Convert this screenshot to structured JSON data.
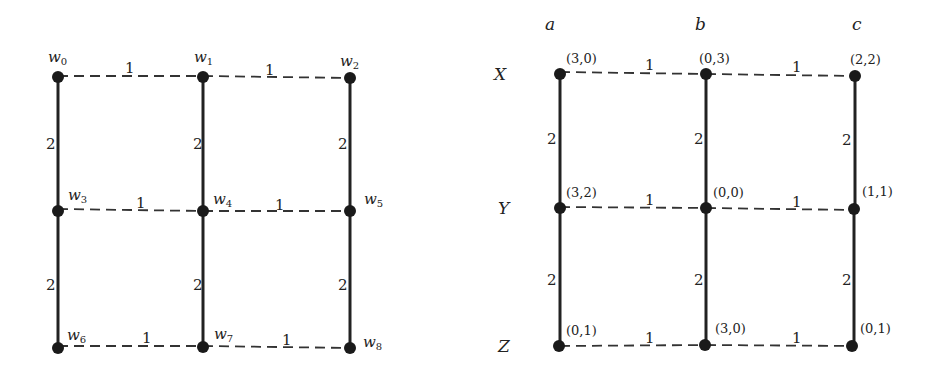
{
  "left_graph": {
    "nodes": [
      {
        "id": "w0",
        "base": "w",
        "sub": "0"
      },
      {
        "id": "w1",
        "base": "w",
        "sub": "1"
      },
      {
        "id": "w2",
        "base": "w",
        "sub": "2"
      },
      {
        "id": "w3",
        "base": "w",
        "sub": "3"
      },
      {
        "id": "w4",
        "base": "w",
        "sub": "4"
      },
      {
        "id": "w5",
        "base": "w",
        "sub": "5"
      },
      {
        "id": "w6",
        "base": "w",
        "sub": "6"
      },
      {
        "id": "w7",
        "base": "w",
        "sub": "7"
      },
      {
        "id": "w8",
        "base": "w",
        "sub": "8"
      }
    ],
    "horizontal_weight": "1",
    "vertical_weight": "2"
  },
  "right_graph": {
    "columns": [
      "a",
      "b",
      "c"
    ],
    "rows": [
      "X",
      "Y",
      "Z"
    ],
    "payoffs": [
      [
        "(3,0)",
        "(0,3)",
        "(2,2)"
      ],
      [
        "(3,2)",
        "(0,0)",
        "(1,1)"
      ],
      [
        "(0,1)",
        "(3,0)",
        "(0,1)"
      ]
    ],
    "horizontal_weight": "1",
    "vertical_weight": "2"
  }
}
